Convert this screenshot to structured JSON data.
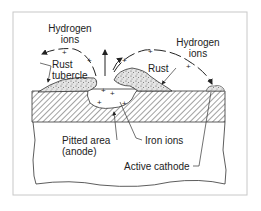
{
  "diagram": {
    "labels": {
      "hydrogen_ions_left_line1": "Hydrogen",
      "hydrogen_ions_left_line2": "ions",
      "hydrogen_ions_right_line1": "Hydrogen",
      "hydrogen_ions_right_line2": "ions",
      "rust_tubercle_line1": "Rust",
      "rust_tubercle_line2": "tubercle",
      "rust": "Rust",
      "pitted_area_line1": "Pitted area",
      "pitted_area_line2": "(anode)",
      "iron_ions": "Iron ions",
      "active_cathode": "Active cathode"
    },
    "symbols": {
      "plus": "+"
    },
    "colors": {
      "frame": "#c8c8c8",
      "line": "#222222",
      "hatch": "#444444",
      "rust_fill": "#d8d8d8"
    }
  }
}
